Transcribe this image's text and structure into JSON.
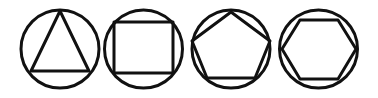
{
  "figure": {
    "background_color": "#ffffff",
    "stroke_color": "#111111",
    "stroke_width": 3,
    "canvas": {
      "width": 378,
      "height": 98
    },
    "item_count": 4,
    "sequence_label": "3, 4, 5, 6"
  },
  "chart_data": {
    "type": "diagram",
    "categories": [
      "triangle",
      "square",
      "pentagon",
      "hexagon"
    ],
    "values": [
      3,
      4,
      5,
      6
    ],
    "xlabel": "",
    "ylabel": "number of sides",
    "grid": false,
    "legend": "none"
  },
  "shapes": [
    {
      "id": "shape-1",
      "polygon_name": "triangle",
      "sides": 3,
      "label": "Triangle",
      "orientation": "vertex-up",
      "circle": {
        "cx": 60,
        "cy": 49,
        "r": 39
      },
      "vertices": "60,11 89,71 31,71"
    },
    {
      "id": "shape-2",
      "polygon_name": "square",
      "sides": 4,
      "label": "Square",
      "orientation": "edge-up",
      "circle": {
        "cx": 143.5,
        "cy": 49,
        "r": 39
      },
      "vertices": "114,22 173,22 173,73 114,73"
    },
    {
      "id": "shape-3",
      "polygon_name": "pentagon",
      "sides": 5,
      "label": "Pentagon",
      "orientation": "vertex-up",
      "circle": {
        "cx": 231,
        "cy": 49,
        "r": 39
      },
      "vertices": "231,12 270,41 255,78 207,78 192,41"
    },
    {
      "id": "shape-4",
      "polygon_name": "hexagon",
      "sides": 6,
      "label": "Hexagon",
      "orientation": "edge-up",
      "circle": {
        "cx": 318.5,
        "cy": 49,
        "r": 39
      },
      "vertices": "300,20 338,20 356,49 338,79 300,79 282,49"
    }
  ]
}
